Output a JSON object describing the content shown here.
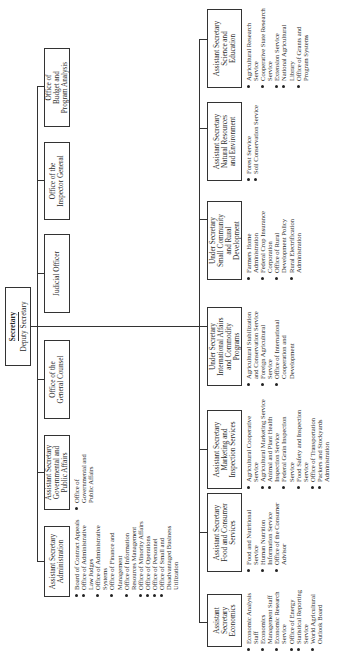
{
  "secretary": {
    "title": "Secretary",
    "subtitle": "Deputy Secretary"
  },
  "staff_offices": [
    {
      "label": "Assistant Secretary\nAdministration",
      "subs": [
        "Board of Contract Appeals",
        "Office of Administrative Law Judges",
        "Office of Administrative Systems",
        "Office of Finance and Management",
        "Office of Information Resources Management",
        "Office of Minority Affairs",
        "Office of Operations",
        "Office of Personnel",
        "Office of Small and Disadvantaged Business Utilization"
      ]
    },
    {
      "label": "Assistant Secretary\nGovernmental and\nPublic Affairs",
      "subs": [
        "Office of Governmental and Public Affairs"
      ]
    },
    {
      "label": "Office of the\nGeneral Counsel",
      "subs": []
    },
    {
      "label": "Judicial Officer",
      "subs": []
    },
    {
      "label": "Office of the\nInspector General",
      "subs": []
    },
    {
      "label": "Office of\nBudget and\nProgram Analysis",
      "subs": []
    }
  ],
  "program_areas": [
    {
      "label": "Assistant\nSecretary\nEconomics",
      "subs": [
        "Economic Analysis Staff",
        "Economics Management Staff",
        "Economic Research Service",
        "Office of Energy",
        "Statistical Reporting Service",
        "World Agricultural Outlook Board"
      ]
    },
    {
      "label": "Assistant Secretary\nFood and Consumer\nServices",
      "subs": [
        "Food and Nutritional Service",
        "Human Nutrition Information Service",
        "Office of the Consumer Advisor"
      ]
    },
    {
      "label": "Assistant Secretary\nMarketing and\nInspection Services",
      "subs": [
        "Agricultural Cooperative Service",
        "Agricultural Marketing Service",
        "Animal and Plant Health Inspection Service",
        "Federal Grain Inspection Service",
        "Food Safety and Inspection Service",
        "Office of Transportation",
        "Packers and Stockyards Administration"
      ]
    },
    {
      "label": "Under Secretary\nInternational Affairs\nand Commodity\nPrograms",
      "subs": [
        "Agricultural Stabilization and Conservation Service",
        "Foreign Agricultural Service",
        "Office of International Cooperation and Development"
      ]
    },
    {
      "label": "Under Secretary\nSmall Community\nand Rural\nDevelopment",
      "subs": [
        "Farmers Home Administration",
        "Federal Crop Insurance Corporation",
        "Office of Rural Development Policy",
        "Rural Electrification Administration"
      ]
    },
    {
      "label": "Assistant Secretary\nNatural Resources\nand Environment",
      "subs": [
        "Forest Service",
        "Soil Conservation Service"
      ]
    },
    {
      "label": "Assistant Secretary\nScience and\nEducation",
      "subs": [
        "Agricultural Research Service",
        "Cooperative State Research Service",
        "Extension Service",
        "National Agricultural Library",
        "Office of Grants and Program Systems"
      ]
    }
  ]
}
